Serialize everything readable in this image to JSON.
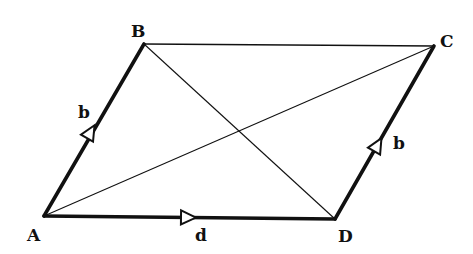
{
  "diagram": {
    "type": "parallelogram",
    "vertices": {
      "A": {
        "label": "A",
        "x": 44,
        "y": 216
      },
      "B": {
        "label": "B",
        "x": 144,
        "y": 44
      },
      "C": {
        "label": "C",
        "x": 434,
        "y": 46
      },
      "D": {
        "label": "D",
        "x": 335,
        "y": 219
      }
    },
    "edges": [
      {
        "from": "A",
        "to": "B",
        "style": "bold",
        "vector": "b",
        "arrow": true
      },
      {
        "from": "A",
        "to": "D",
        "style": "bold",
        "vector": "d",
        "arrow": true
      },
      {
        "from": "D",
        "to": "C",
        "style": "bold",
        "vector": "b",
        "arrow": true
      },
      {
        "from": "B",
        "to": "C",
        "style": "thin",
        "arrow": false
      }
    ],
    "diagonals": [
      {
        "from": "A",
        "to": "C"
      },
      {
        "from": "B",
        "to": "D"
      }
    ],
    "vector_labels": {
      "ab": "b",
      "ad": "d",
      "dc": "b"
    },
    "colors": {
      "stroke": "#111111",
      "background": "#ffffff"
    }
  }
}
